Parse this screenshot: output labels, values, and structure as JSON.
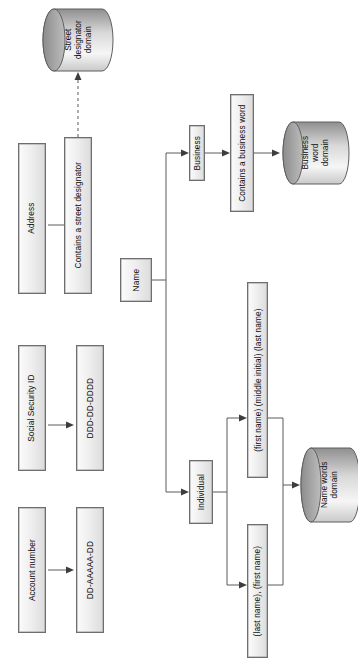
{
  "diagram": {
    "orientation": "rotated-90-ccw",
    "colors": {
      "box_border": "#6e6e6e",
      "box_fill_light": "#fbfbfb",
      "box_fill_dark": "#dcdcdc",
      "cylinder_top": "#8a8a8a",
      "cylinder_body_light": "#f2f2f2",
      "connector": "#5a5a5a",
      "arrowhead": "#3d3d3d",
      "background": "#ffffff"
    },
    "nodes": {
      "account_number": "Account number",
      "account_pattern": "DD-AAAAA-DD",
      "social_security_id": "Social Security ID",
      "social_pattern": "DDD-DD-DDDD",
      "address": "Address",
      "address_rule": "Contains a street designator",
      "name": "Name",
      "business": "Business",
      "business_rule": "Contains a business word",
      "individual": "Individual",
      "individual_format_1": "(first name) (middle initial) (last name)",
      "individual_format_2": "(last name), (first name)"
    },
    "datastores": {
      "street_designator_domain": "Street\ndesignator\ndomain",
      "business_word_domain": "Business\nword\ndomain",
      "name_words_domain": "Name words\ndomain"
    },
    "edges": [
      {
        "from": "Account number",
        "to": "DD-AAAAA-DD",
        "style": "solid"
      },
      {
        "from": "Social Security ID",
        "to": "DDD-DD-DDDD",
        "style": "solid"
      },
      {
        "from": "Address",
        "to": "Contains a street designator",
        "style": "solid"
      },
      {
        "from": "Contains a street designator",
        "to": "Street designator domain",
        "style": "dashed"
      },
      {
        "from": "Name",
        "to": "Business",
        "style": "solid"
      },
      {
        "from": "Name",
        "to": "Individual",
        "style": "solid"
      },
      {
        "from": "Business",
        "to": "Contains a business word",
        "style": "solid"
      },
      {
        "from": "Contains a business word",
        "to": "Business word domain",
        "style": "solid"
      },
      {
        "from": "Individual",
        "to": "(first name) (middle initial) (last name)",
        "style": "solid"
      },
      {
        "from": "Individual",
        "to": "(last name), (first name)",
        "style": "solid"
      },
      {
        "from": "(first name) (middle initial) (last name)",
        "to": "Name words domain",
        "style": "solid"
      },
      {
        "from": "(last name), (first name)",
        "to": "Name words domain",
        "style": "solid"
      }
    ]
  }
}
